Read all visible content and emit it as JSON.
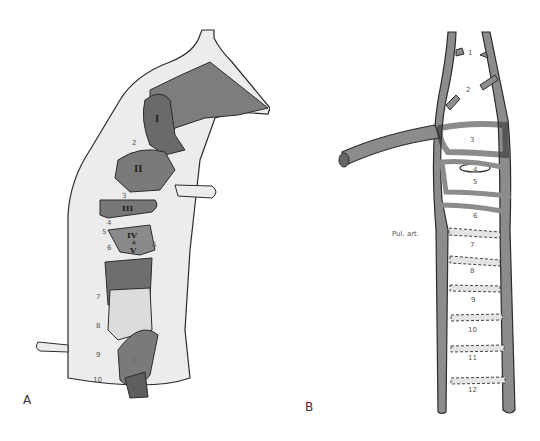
{
  "figure": {
    "panels": [
      {
        "id": "A",
        "letter": "A",
        "description": "Embryonic heart / venous sinus cast with aortic arches, lateral view",
        "roman_labels": [
          "I",
          "II",
          "III",
          "IV",
          "+",
          "V",
          "L"
        ],
        "arch_numbers": [
          "2",
          "3",
          "4",
          "5",
          "6",
          "6",
          "7",
          "8",
          "9",
          "10"
        ]
      },
      {
        "id": "B",
        "letter": "B",
        "description": "Schematic of aortic arch system",
        "vessel_labels": [
          "1",
          "2",
          "3",
          "4",
          "5",
          "6",
          "7",
          "8",
          "9",
          "10",
          "11",
          "12"
        ],
        "annotation": "Pul. art."
      }
    ],
    "colors": {
      "vessel_light": "#ececec",
      "vessel_mid": "#8c8c8c",
      "vessel_dark": "#5e5e5e",
      "outline": "#2b2b2b",
      "label": "#555555"
    }
  }
}
